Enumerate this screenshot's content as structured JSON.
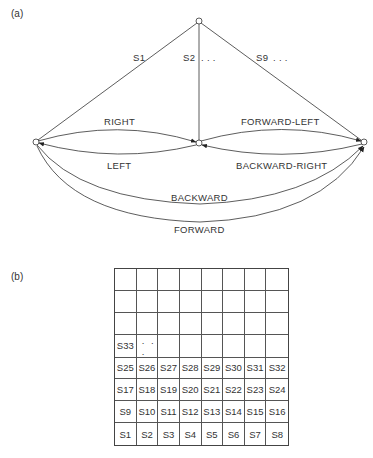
{
  "panels": {
    "a": {
      "label": "(a)"
    },
    "b": {
      "label": "(b)"
    }
  },
  "diagram": {
    "nodes": [
      {
        "id": "top",
        "x": 199,
        "y": 21
      },
      {
        "id": "left",
        "x": 36,
        "y": 142
      },
      {
        "id": "middle",
        "x": 199,
        "y": 143
      },
      {
        "id": "right",
        "x": 364,
        "y": 142
      }
    ],
    "edge_labels": {
      "s1": "S1",
      "s2": "S2",
      "s2_dots": ". . .",
      "s9": "S9",
      "s9_dots": ". . .",
      "right": "RIGHT",
      "left": "LEFT",
      "forward_left": "FORWARD-LEFT",
      "backward_right": "BACKWARD-RIGHT",
      "backward": "BACKWARD",
      "forward": "FORWARD"
    }
  },
  "grid": {
    "rows": 8,
    "cols": 8,
    "cells": [
      [
        "",
        "",
        "",
        "",
        "",
        "",
        "",
        ""
      ],
      [
        "",
        "",
        "",
        "",
        "",
        "",
        "",
        ""
      ],
      [
        "",
        "",
        "",
        "",
        "",
        "",
        "",
        ""
      ],
      [
        "S33",
        ". . .",
        "",
        "",
        "",
        "",
        "",
        ""
      ],
      [
        "S25",
        "S26",
        "S27",
        "S28",
        "S29",
        "S30",
        "S31",
        "S32"
      ],
      [
        "S17",
        "S18",
        "S19",
        "S20",
        "S21",
        "S22",
        "S23",
        "S24"
      ],
      [
        "S9",
        "S10",
        "S11",
        "S12",
        "S13",
        "S14",
        "S15",
        "S16"
      ],
      [
        "S1",
        "S2",
        "S3",
        "S4",
        "S5",
        "S6",
        "S7",
        "S8"
      ]
    ]
  }
}
